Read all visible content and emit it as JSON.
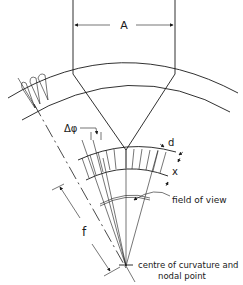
{
  "diagram": {
    "labels": {
      "aperture_width": "A",
      "angular_spacing": "Δφ",
      "diameter": "d",
      "depth": "x",
      "focal_length": "f",
      "field_of_view": "field of view",
      "centre_line1": "centre of curvature and",
      "centre_line2": "nodal point"
    },
    "colors": {
      "stroke": "#1a1a1a",
      "background": "#ffffff"
    }
  }
}
